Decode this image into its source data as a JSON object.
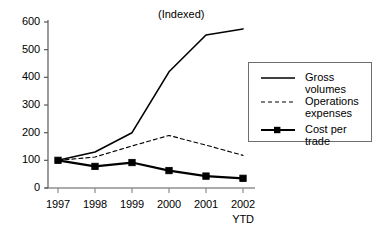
{
  "chart_data": {
    "type": "line",
    "title": "(Indexed)",
    "xlabel": "",
    "ylabel": "",
    "categories": [
      "1997",
      "1998",
      "1999",
      "2000",
      "2001",
      "2002"
    ],
    "x_tick_sublabels": [
      "",
      "",
      "",
      "",
      "",
      "YTD"
    ],
    "ylim": [
      0,
      600
    ],
    "y_ticks": [
      0,
      100,
      200,
      300,
      400,
      500,
      600
    ],
    "grid": false,
    "legend_position": "right",
    "series": [
      {
        "name": "Gross volumes",
        "style": "solid",
        "marker": "none",
        "color": "#000000",
        "values": [
          100,
          130,
          200,
          420,
          553,
          575
        ]
      },
      {
        "name": "Operations expenses",
        "style": "dashed",
        "marker": "none",
        "color": "#000000",
        "values": [
          100,
          112,
          152,
          190,
          155,
          118
        ]
      },
      {
        "name": "Cost per trade",
        "style": "solid-thick",
        "marker": "square",
        "color": "#000000",
        "values": [
          100,
          78,
          92,
          63,
          43,
          35
        ]
      }
    ]
  },
  "legend": {
    "items": [
      {
        "label": "Gross volumes",
        "swatch": "solid-line-swatch"
      },
      {
        "label": "Operations\nexpenses",
        "swatch": "dashed-line-swatch"
      },
      {
        "label": "Cost per trade",
        "swatch": "square-marker-line-swatch"
      }
    ]
  },
  "axes": {
    "y_tick_labels": [
      "600",
      "500",
      "400",
      "300",
      "200",
      "100",
      "0"
    ],
    "x_tick_labels": [
      "1997",
      "1998",
      "1999",
      "2000",
      "2001",
      "2002"
    ],
    "x_tick_sub": "YTD"
  }
}
